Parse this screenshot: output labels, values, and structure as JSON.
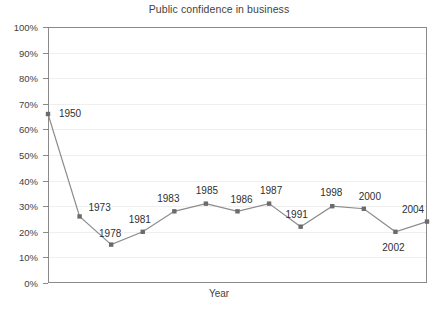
{
  "chart_data": {
    "type": "line",
    "title": "Public confidence in business",
    "xlabel": "Year",
    "ylabel": "",
    "categories": [
      "1950",
      "1973",
      "1978",
      "1981",
      "1983",
      "1985",
      "1986",
      "1987",
      "1991",
      "1998",
      "2000",
      "2002",
      "2004"
    ],
    "x": [
      1950,
      1973,
      1978,
      1981,
      1983,
      1985,
      1986,
      1987,
      1991,
      1998,
      2000,
      2002,
      2004
    ],
    "values": [
      66,
      26,
      15,
      20,
      28,
      31,
      28,
      31,
      22,
      30,
      29,
      20,
      24
    ],
    "series": [
      {
        "name": "Public confidence in business",
        "values": [
          66,
          26,
          15,
          20,
          28,
          31,
          28,
          31,
          22,
          30,
          29,
          20,
          24
        ]
      }
    ],
    "point_labels": [
      "1950",
      "1973",
      "1978",
      "1981",
      "1983",
      "1985",
      "1986",
      "1987",
      "1991",
      "1998",
      "2000",
      "2002",
      "2004"
    ],
    "ylim": [
      0,
      100
    ],
    "ytick_labels": [
      "100%",
      "90%",
      "80%",
      "70%",
      "60%",
      "50%",
      "40%",
      "30%",
      "20%",
      "10%",
      "0%"
    ],
    "ytick_values": [
      100,
      90,
      80,
      70,
      60,
      50,
      40,
      30,
      20,
      10,
      0
    ],
    "xtick_labels": [],
    "grid": true,
    "legend": false,
    "line_color": "#8c8c8c",
    "marker_color": "#6b6b6b",
    "grid_color": "#efefef",
    "axis_color": "#8a8a8a",
    "background": "#ffffff"
  },
  "axis_title": {
    "x": "Year"
  }
}
